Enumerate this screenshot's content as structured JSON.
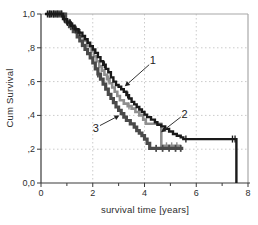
{
  "chart_data": {
    "type": "line",
    "variant": "kaplan-meier-step",
    "title": "",
    "xlabel": "survival time [years]",
    "ylabel": "Cum Survival",
    "xlim": [
      0,
      8
    ],
    "ylim": [
      0,
      1
    ],
    "grid": "dotted",
    "legend_position": "none",
    "colors": {
      "axis": "#3a3a3a",
      "grid": "#cbcbcb",
      "frame_border": "#a8a8a8",
      "text": "#2e2e2e",
      "background": "#ffffff"
    },
    "x_ticks": [
      {
        "v": 0,
        "label": "0",
        "major": true
      },
      {
        "v": 1,
        "label": "",
        "major": false
      },
      {
        "v": 2,
        "label": "2",
        "major": true
      },
      {
        "v": 3,
        "label": "",
        "major": false
      },
      {
        "v": 4,
        "label": "4",
        "major": true
      },
      {
        "v": 5,
        "label": "",
        "major": false
      },
      {
        "v": 6,
        "label": "6",
        "major": true
      },
      {
        "v": 7,
        "label": "",
        "major": false
      },
      {
        "v": 8,
        "label": "8",
        "major": true
      }
    ],
    "y_ticks": [
      {
        "v": 0,
        "label": "0,0"
      },
      {
        "v": 0.2,
        "label": ",2"
      },
      {
        "v": 0.4,
        "label": ",4"
      },
      {
        "v": 0.6,
        "label": ",6"
      },
      {
        "v": 0.8,
        "label": ",8"
      },
      {
        "v": 1,
        "label": "1,0"
      }
    ],
    "series": [
      {
        "name": "2",
        "color": "#8f8f8f",
        "width": 2.6,
        "points": [
          [
            0.2,
            1.0
          ],
          [
            0.9,
            0.965
          ],
          [
            1.05,
            0.94
          ],
          [
            1.2,
            0.915
          ],
          [
            1.35,
            0.89
          ],
          [
            1.5,
            0.865
          ],
          [
            1.65,
            0.84
          ],
          [
            1.8,
            0.81
          ],
          [
            1.95,
            0.78
          ],
          [
            2.05,
            0.75
          ],
          [
            2.15,
            0.72
          ],
          [
            2.25,
            0.69
          ],
          [
            2.35,
            0.665
          ],
          [
            2.45,
            0.64
          ],
          [
            2.55,
            0.615
          ],
          [
            2.65,
            0.59
          ],
          [
            2.75,
            0.565
          ],
          [
            2.85,
            0.54
          ],
          [
            2.95,
            0.515
          ],
          [
            3.05,
            0.49
          ],
          [
            3.2,
            0.47
          ],
          [
            3.35,
            0.455
          ],
          [
            3.5,
            0.44
          ],
          [
            3.65,
            0.42
          ],
          [
            3.8,
            0.4
          ],
          [
            3.95,
            0.375
          ],
          [
            4.05,
            0.35
          ],
          [
            4.65,
            0.22
          ],
          [
            5.35,
            0.215
          ]
        ],
        "censor_x": [
          0.3,
          0.45,
          0.6,
          0.75,
          0.95,
          1.1,
          1.3,
          2.6,
          3.4,
          4.85,
          5.05,
          5.25
        ]
      },
      {
        "name": "3",
        "color": "#4a4a4a",
        "width": 3.2,
        "points": [
          [
            0.25,
            1.0
          ],
          [
            0.95,
            0.955
          ],
          [
            1.1,
            0.925
          ],
          [
            1.25,
            0.895
          ],
          [
            1.4,
            0.865
          ],
          [
            1.5,
            0.84
          ],
          [
            1.6,
            0.815
          ],
          [
            1.7,
            0.79
          ],
          [
            1.8,
            0.765
          ],
          [
            1.9,
            0.74
          ],
          [
            2.0,
            0.71
          ],
          [
            2.1,
            0.675
          ],
          [
            2.2,
            0.645
          ],
          [
            2.3,
            0.615
          ],
          [
            2.4,
            0.585
          ],
          [
            2.5,
            0.555
          ],
          [
            2.6,
            0.525
          ],
          [
            2.7,
            0.5
          ],
          [
            2.8,
            0.475
          ],
          [
            2.9,
            0.45
          ],
          [
            3.0,
            0.43
          ],
          [
            3.1,
            0.41
          ],
          [
            3.2,
            0.39
          ],
          [
            3.3,
            0.37
          ],
          [
            3.45,
            0.35
          ],
          [
            3.6,
            0.33
          ],
          [
            3.7,
            0.31
          ],
          [
            3.8,
            0.295
          ],
          [
            3.9,
            0.28
          ],
          [
            4.0,
            0.26
          ],
          [
            4.1,
            0.235
          ],
          [
            4.2,
            0.205
          ],
          [
            5.5,
            0.205
          ]
        ],
        "censor_x": [
          0.35,
          0.5,
          0.65,
          0.8,
          1.0,
          1.15,
          2.2,
          4.45,
          4.7,
          4.95,
          5.2,
          5.4
        ]
      },
      {
        "name": "1",
        "color": "#1a1a1a",
        "width": 2.4,
        "points": [
          [
            0.15,
            1.0
          ],
          [
            0.85,
            0.97
          ],
          [
            1.0,
            0.95
          ],
          [
            1.15,
            0.93
          ],
          [
            1.3,
            0.91
          ],
          [
            1.45,
            0.89
          ],
          [
            1.6,
            0.87
          ],
          [
            1.7,
            0.85
          ],
          [
            1.8,
            0.83
          ],
          [
            1.9,
            0.81
          ],
          [
            2.0,
            0.79
          ],
          [
            2.1,
            0.77
          ],
          [
            2.2,
            0.745
          ],
          [
            2.3,
            0.72
          ],
          [
            2.4,
            0.7
          ],
          [
            2.5,
            0.675
          ],
          [
            2.6,
            0.655
          ],
          [
            2.7,
            0.625
          ],
          [
            2.8,
            0.6
          ],
          [
            2.9,
            0.58
          ],
          [
            3.0,
            0.57
          ],
          [
            3.1,
            0.555
          ],
          [
            3.2,
            0.54
          ],
          [
            3.3,
            0.52
          ],
          [
            3.4,
            0.5
          ],
          [
            3.5,
            0.48
          ],
          [
            3.6,
            0.465
          ],
          [
            3.7,
            0.45
          ],
          [
            3.8,
            0.435
          ],
          [
            3.9,
            0.42
          ],
          [
            4.0,
            0.405
          ],
          [
            4.1,
            0.39
          ],
          [
            4.25,
            0.375
          ],
          [
            4.4,
            0.36
          ],
          [
            4.5,
            0.345
          ],
          [
            4.65,
            0.335
          ],
          [
            4.8,
            0.32
          ],
          [
            4.95,
            0.305
          ],
          [
            5.1,
            0.29
          ],
          [
            5.25,
            0.28
          ],
          [
            5.4,
            0.27
          ],
          [
            5.5,
            0.26
          ],
          [
            7.55,
            0.26
          ],
          [
            7.55,
            0.0
          ]
        ],
        "censor_x": [
          0.25,
          0.33,
          0.4,
          0.48,
          0.55,
          0.62,
          0.7,
          0.78,
          0.9,
          1.02,
          1.12,
          1.22,
          1.35,
          1.5,
          2.45,
          3.35,
          5.6,
          7.4,
          7.5
        ]
      }
    ],
    "annotations": [
      {
        "text": "1",
        "label_xy": [
          4.32,
          0.73
        ],
        "arrow_from": [
          4.18,
          0.7
        ],
        "arrow_to": [
          3.24,
          0.572
        ]
      },
      {
        "text": "2",
        "label_xy": [
          5.55,
          0.41
        ],
        "arrow_from": [
          5.4,
          0.39
        ],
        "arrow_to": [
          4.64,
          0.3
        ]
      },
      {
        "text": "3",
        "label_xy": [
          2.12,
          0.325
        ],
        "arrow_from": [
          2.28,
          0.34
        ],
        "arrow_to": [
          3.03,
          0.4
        ]
      }
    ]
  }
}
